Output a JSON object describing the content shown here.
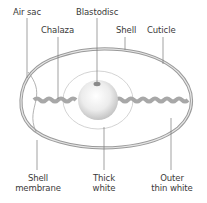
{
  "labels": {
    "air_sac": "Air sac",
    "blastodisc": "Blastodisc",
    "chalaza": "Chalaza",
    "shell": "Shell",
    "cuticle": "Cuticle",
    "shell_membrane_1": "Shell",
    "shell_membrane_2": "membrane",
    "thick_white_1": "Thick",
    "thick_white_2": "white",
    "outer_thin_white_1": "Outer",
    "outer_thin_white_2": "thin white"
  },
  "colors": {
    "shell_outline": "#8c8c8c",
    "shell_fill": "#d9d9d9",
    "chalaza": "#a8a8a8",
    "yolk_light": "#fafafa",
    "yolk_dark": "#bdbdbd",
    "leader_line": "#7a7a7a",
    "text": "#3a3a3a"
  }
}
